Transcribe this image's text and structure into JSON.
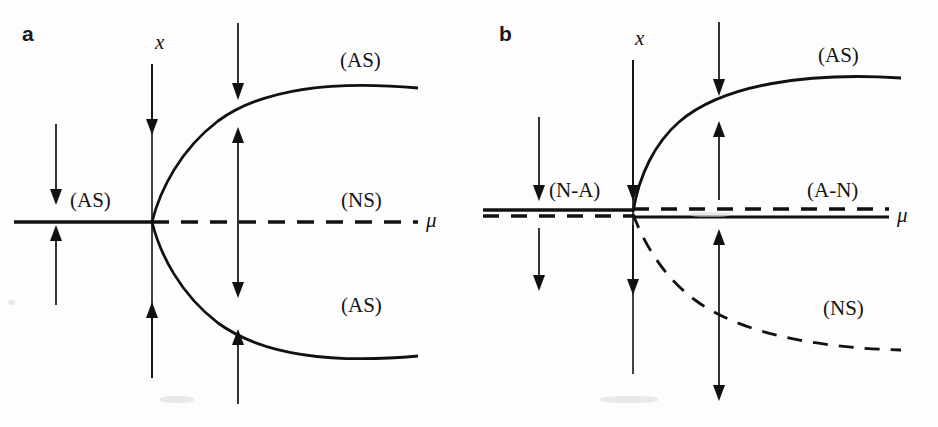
{
  "figure": {
    "width": 938,
    "height": 427,
    "background": "#fdfdfd",
    "stroke_color": "#111111",
    "caption_font_color": "#141414"
  },
  "panels": [
    {
      "id": "a",
      "letter": "a",
      "type": "supercritical-pitchfork",
      "vertical_axis_label": "x",
      "horizontal_axis_label": "μ",
      "labels": [
        {
          "name": "upper-branch-label",
          "text": "(AS)",
          "x": 340,
          "y": 48
        },
        {
          "name": "left-branch-label",
          "text": "(AS)",
          "x": 70,
          "y": 188
        },
        {
          "name": "middle-branch-label",
          "text": "(NS)",
          "x": 341,
          "y": 188
        },
        {
          "name": "lower-branch-label",
          "text": "(AS)",
          "x": 341,
          "y": 293
        }
      ],
      "geometry": {
        "bifurcation_point": [
          152,
          222
        ],
        "axis_y": 222,
        "axis_x_start": 14,
        "axis_x_end": 418,
        "vertical_axis_top": 64,
        "vertical_axis_bottom": 378,
        "solid_segment": [
          14,
          152
        ],
        "dashed_segment": [
          152,
          418
        ],
        "parabola_right_x": 418,
        "parabola_upper_y": 88,
        "parabola_lower_y": 356
      },
      "arrows": [
        {
          "name": "flow-arrow-left-down",
          "x": 56,
          "y1": 124,
          "y2": 203,
          "heads": "end"
        },
        {
          "name": "flow-arrow-left-up",
          "x": 56,
          "y1": 305,
          "y2": 227,
          "heads": "end"
        },
        {
          "name": "flow-arrow-axis-down",
          "x": 152,
          "y1": 64,
          "y2": 134,
          "heads": "end"
        },
        {
          "name": "flow-arrow-axis-up",
          "x": 152,
          "y1": 378,
          "y2": 303,
          "heads": "end"
        },
        {
          "name": "flow-arrow-top-down",
          "x": 238,
          "y1": 23,
          "y2": 99,
          "heads": "end"
        },
        {
          "name": "flow-arrow-inner-double",
          "x": 238,
          "y1": 128,
          "y2": 297,
          "heads": "both"
        },
        {
          "name": "flow-arrow-bottom-up",
          "x": 238,
          "y1": 404,
          "y2": 330,
          "heads": "end"
        }
      ]
    },
    {
      "id": "b",
      "letter": "b",
      "type": "transcritical",
      "vertical_axis_label": "x",
      "horizontal_axis_label": "μ",
      "labels": [
        {
          "name": "upper-branch-label",
          "text": "(AS)",
          "x": 349,
          "y": 43
        },
        {
          "name": "left-branch-label",
          "text": "(N-A)",
          "x": 80,
          "y": 178
        },
        {
          "name": "right-branch-label",
          "text": "(A-N)",
          "x": 338,
          "y": 178
        },
        {
          "name": "lower-branch-label",
          "text": "(NS)",
          "x": 354,
          "y": 296
        }
      ],
      "geometry": {
        "bifurcation_point": [
          164,
          212
        ],
        "axis_x_start": 14,
        "axis_x_end": 420,
        "solid_left_y": 210,
        "dashed_left_y": 216,
        "dashed_right_y": 209,
        "solid_right_y": 217,
        "vertical_axis_top": 60,
        "vertical_axis_bottom": 374,
        "as_curve_end_x": 432,
        "as_curve_end_y": 78,
        "ns_curve_end_x": 432,
        "ns_curve_end_y": 350
      },
      "arrows": [
        {
          "name": "flow-arrow-left-down-upper",
          "x": 70,
          "y1": 117,
          "y2": 199,
          "heads": "end"
        },
        {
          "name": "flow-arrow-left-down-lower",
          "x": 70,
          "y1": 228,
          "y2": 290,
          "heads": "end"
        },
        {
          "name": "flow-arrow-axis-down-upper",
          "x": 164,
          "y1": 60,
          "y2": 200,
          "heads": "end"
        },
        {
          "name": "flow-arrow-axis-down-lower",
          "x": 164,
          "y1": 225,
          "y2": 294,
          "heads": "end"
        },
        {
          "name": "flow-arrow-top-down",
          "x": 250,
          "y1": 22,
          "y2": 95,
          "heads": "end"
        },
        {
          "name": "flow-arrow-upper-up",
          "x": 250,
          "y1": 200,
          "y2": 122,
          "heads": "end"
        },
        {
          "name": "flow-arrow-lower-double",
          "x": 250,
          "y1": 230,
          "y2": 400,
          "heads": "both"
        }
      ]
    }
  ]
}
